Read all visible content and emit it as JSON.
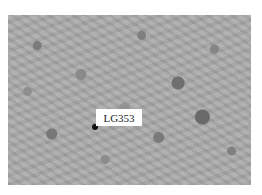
{
  "image": {
    "label": "LG353"
  }
}
